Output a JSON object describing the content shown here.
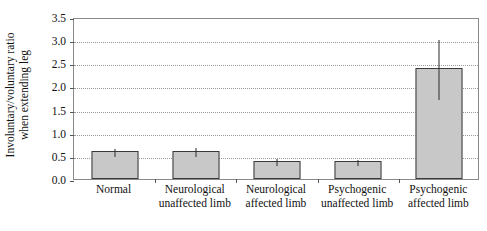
{
  "chart_data": {
    "type": "bar",
    "title": "",
    "xlabel": "",
    "ylabel_lines": [
      "Involuntary/voluntary ratio",
      "when extending leg"
    ],
    "ylabel": "Involuntary/voluntary ratio when extending leg",
    "ylim": [
      0.0,
      3.5
    ],
    "ytick_labels": [
      "0.0",
      "0.5",
      "1.0",
      "1.5",
      "2.0",
      "2.5",
      "3.0",
      "3.5"
    ],
    "ytick_values": [
      0.0,
      0.5,
      1.0,
      1.5,
      2.0,
      2.5,
      3.0,
      3.5
    ],
    "grid": true,
    "grid_style": "dotted horizontal",
    "legend": "none",
    "categories": [
      "Normal",
      "Neurological unaffected limb",
      "Neurological affected limb",
      "Psychogenic unaffected limb",
      "Psychogenic affected limb"
    ],
    "category_label_lines": [
      [
        "Normal"
      ],
      [
        "Neurological",
        "unaffected limb"
      ],
      [
        "Neurological",
        "affected limb"
      ],
      [
        "Psychogenic",
        "unaffected limb"
      ],
      [
        "Psychogenic",
        "affected limb"
      ]
    ],
    "values": [
      0.6,
      0.6,
      0.4,
      0.4,
      2.4
    ],
    "error_low": [
      0.52,
      0.52,
      0.33,
      0.33,
      1.75
    ],
    "error_high": [
      0.7,
      0.72,
      0.48,
      0.46,
      3.05
    ],
    "bar_fill_color": "#c8c8c8",
    "bar_edge_color": "#3a3a3a",
    "error_bar_color": "#2a2a2a",
    "axis_color": "#8a8a8a",
    "gridline_color": "#9a9a9a",
    "background_color": "#ffffff"
  }
}
